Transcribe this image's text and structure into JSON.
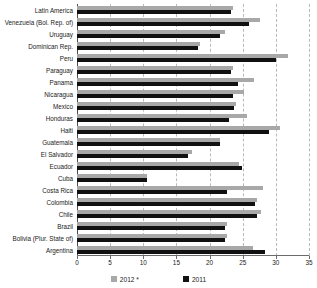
{
  "chart_data": {
    "type": "bar",
    "orientation": "horizontal",
    "title": "",
    "subtitle": "",
    "xlabel": "",
    "ylabel": "",
    "xlim": [
      0,
      35
    ],
    "xticks": [
      0,
      5,
      10,
      15,
      20,
      25,
      30,
      35
    ],
    "xtick_labels": [
      "0",
      "5",
      "10",
      "15",
      "20",
      "25",
      "30",
      "35"
    ],
    "grid": true,
    "grid_axis": "x",
    "grid_style": "dashed",
    "legend_position": "bottom",
    "categories": [
      "Latin America",
      "Venezuela (Bol. Rep. of)",
      "Uruguay",
      "Dominican Rep.",
      "Peru",
      "Paraguay",
      "Panama",
      "Nicaragua",
      "Mexico",
      "Honduras",
      "Haiti",
      "Guatemala",
      "El Salvador",
      "Ecuador",
      "Cuba",
      "Costa Rica",
      "Colombia",
      "Chile",
      "Brazil",
      "Bolivia (Plur. State of)",
      "Argentina"
    ],
    "series": [
      {
        "name": "2012 *",
        "color": "#a8a8a8",
        "values": [
          23.6,
          27.6,
          22.4,
          18.5,
          31.8,
          23.6,
          26.7,
          25.2,
          24.0,
          25.6,
          30.7,
          21.5,
          17.3,
          24.5,
          10.6,
          28.0,
          27.2,
          27.7,
          22.6,
          22.6,
          26.5
        ]
      },
      {
        "name": "2011",
        "color": "#111111",
        "values": [
          23.3,
          25.9,
          21.6,
          18.2,
          30.0,
          23.3,
          24.3,
          23.5,
          23.7,
          23.0,
          29.0,
          21.5,
          16.7,
          24.9,
          10.6,
          22.6,
          26.8,
          27.2,
          22.3,
          22.3,
          28.4
        ]
      }
    ]
  },
  "legend": {
    "entries": [
      {
        "label": "2012 *",
        "swatch_name": "legend-swatch-2012"
      },
      {
        "label": "2011",
        "swatch_name": "legend-swatch-2011"
      }
    ]
  },
  "colors": {
    "series_2012": "#a8a8a8",
    "series_2011": "#111111",
    "gridline": "#b9b9b9",
    "axis": "#6b6b6b",
    "text": "#1a1a1a",
    "background": "#ffffff"
  }
}
